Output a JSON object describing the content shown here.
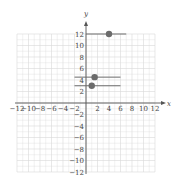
{
  "chart_data": {
    "type": "scatter",
    "title": "",
    "xlabel": "x",
    "ylabel": "y",
    "xlim": [
      -12,
      12
    ],
    "ylim": [
      -12,
      12
    ],
    "grid": true,
    "grid_step": 2,
    "x_ticks": [
      "-12",
      "-10",
      "-8",
      "-6",
      "-4",
      "-2",
      "2",
      "4",
      "6",
      "8",
      "10",
      "12"
    ],
    "y_ticks": [
      "12",
      "10",
      "8",
      "6",
      "4",
      "2",
      "-2",
      "-4",
      "-6",
      "-8",
      "-10",
      "-12"
    ],
    "points": [
      {
        "x": 4,
        "y": 12
      },
      {
        "x": 1.5,
        "y": 4.5
      },
      {
        "x": 1,
        "y": 3
      }
    ],
    "segments": [
      {
        "y": 12,
        "x_start": 0,
        "x_end": 7
      },
      {
        "y": 4.5,
        "x_start": -2,
        "x_end": 6
      },
      {
        "y": 3,
        "x_start": -2,
        "x_end": 6
      }
    ],
    "colors": {
      "grid": "#d9d9d9",
      "axis": "#555555",
      "point": "#6b6b6b",
      "segment": "#6b6b6b"
    }
  }
}
